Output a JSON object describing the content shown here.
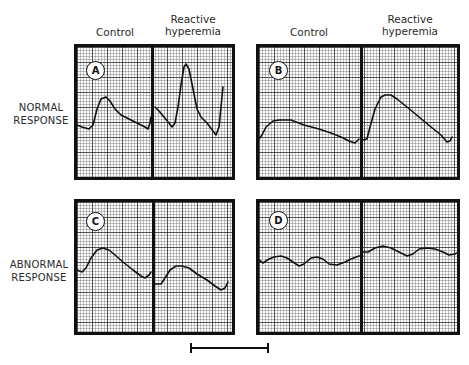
{
  "columns": {
    "left": {
      "control": "Control",
      "reactive_line1": "Reactive",
      "reactive_line2": "hyperemia"
    },
    "right": {
      "control": "Control",
      "reactive_line1": "Reactive",
      "reactive_line2": "hyperemia"
    }
  },
  "rows": {
    "normal": {
      "line1": "NORMAL",
      "line2": "RESPONSE"
    },
    "abnormal": {
      "line1": "ABNORMAL",
      "line2": "RESPONSE"
    }
  },
  "panels": [
    {
      "id": "A",
      "label": "A",
      "row": "normal",
      "column": "left",
      "control_trace": "0,78 5,80 12,82 16,78 20,62 24,52 29,50 33,54 38,62 44,68 52,72 60,76 68,80 71,82 73,76 74,70",
      "reactive_trace": "0,60 4,64 9,70 14,76 17,80 20,76 23,60 26,38 29,20 31,17 34,22 38,42 42,62 46,70 52,76 58,84 61,88 64,80 66,60 68,40"
    },
    {
      "id": "B",
      "label": "B",
      "row": "normal",
      "column": "right",
      "control_trace": "0,92 3,88 7,80 14,74 20,73 32,73 45,78 60,82 72,86 82,90 90,94 96,96 100,92",
      "reactive_trace": "0,93 4,92 7,80 12,62 18,50 22,48 28,48 34,52 44,60 56,70 68,80 78,88 84,95 87,94 89,90"
    },
    {
      "id": "C",
      "label": "C",
      "row": "abnormal",
      "column": "left",
      "control_trace": "0,68 5,70 9,66 14,56 20,48 26,46 32,48 38,53 46,60 56,68 64,74 68,76 72,73 74,70",
      "reactive_trace": "0,82 6,82 10,76 15,68 21,64 27,64 34,66 42,72 52,78 60,84 66,88 70,86 73,80"
    },
    {
      "id": "D",
      "label": "D",
      "row": "abnormal",
      "column": "right",
      "control_trace": "0,58 4,61 10,57 15,55 22,54 28,56 34,60 40,64 45,62 52,56 58,55 64,57 70,62 78,63 86,60 92,57 100,54 104,54",
      "reactive_trace": "0,50 5,50 12,46 20,44 28,46 36,50 44,54 50,52 56,47 64,46 72,47 80,50 86,53 92,52 96,50"
    }
  ],
  "scale_bar": {
    "label": ""
  }
}
